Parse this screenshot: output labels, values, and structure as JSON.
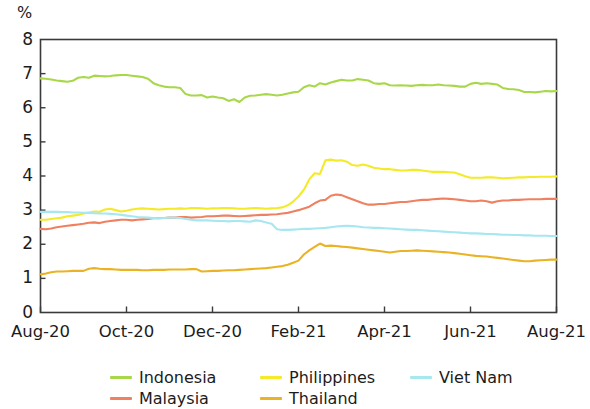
{
  "chart_data": {
    "type": "line",
    "title": "",
    "subtitle": "",
    "xlabel": "",
    "ylabel": "%",
    "ylim": [
      0,
      8
    ],
    "yticks": [
      0,
      1,
      2,
      3,
      4,
      5,
      6,
      7,
      8
    ],
    "ytick_labels": [
      "0",
      "1",
      "2",
      "3",
      "4",
      "5",
      "6",
      "7",
      "8"
    ],
    "xtick_labels": [
      "Aug-20",
      "Oct-20",
      "Dec-20",
      "Feb-21",
      "Apr-21",
      "Jun-21",
      "Aug-21"
    ],
    "x_range": [
      "Aug-20",
      "Aug-21"
    ],
    "grid": false,
    "frame": true,
    "legend_position": "bottom",
    "legend_columns": 3,
    "series": [
      {
        "name": "Indonesia",
        "color": "#a8d84a",
        "values": [
          6.86,
          6.85,
          6.83,
          6.8,
          6.78,
          6.76,
          6.79,
          6.88,
          6.9,
          6.88,
          6.94,
          6.93,
          6.92,
          6.93,
          6.95,
          6.96,
          6.96,
          6.94,
          6.92,
          6.9,
          6.85,
          6.72,
          6.66,
          6.62,
          6.6,
          6.6,
          6.58,
          6.4,
          6.36,
          6.36,
          6.37,
          6.3,
          6.33,
          6.3,
          6.28,
          6.2,
          6.25,
          6.17,
          6.3,
          6.35,
          6.36,
          6.38,
          6.4,
          6.38,
          6.36,
          6.38,
          6.42,
          6.45,
          6.47,
          6.6,
          6.66,
          6.62,
          6.72,
          6.68,
          6.74,
          6.78,
          6.82,
          6.8,
          6.8,
          6.84,
          6.82,
          6.8,
          6.72,
          6.7,
          6.72,
          6.66,
          6.65,
          6.66,
          6.65,
          6.64,
          6.66,
          6.67,
          6.66,
          6.66,
          6.68,
          6.66,
          6.65,
          6.64,
          6.62,
          6.62,
          6.7,
          6.73,
          6.7,
          6.72,
          6.7,
          6.68,
          6.58,
          6.55,
          6.54,
          6.52,
          6.46,
          6.46,
          6.45,
          6.47,
          6.49,
          6.48,
          6.49
        ]
      },
      {
        "name": "Philippines",
        "color": "#f4ea2a",
        "values": [
          2.72,
          2.72,
          2.74,
          2.76,
          2.78,
          2.82,
          2.84,
          2.86,
          2.9,
          2.93,
          2.96,
          2.95,
          3.02,
          3.04,
          3.0,
          2.96,
          2.98,
          3.02,
          3.04,
          3.05,
          3.04,
          3.03,
          3.02,
          3.03,
          3.04,
          3.04,
          3.05,
          3.04,
          3.06,
          3.06,
          3.05,
          3.04,
          3.05,
          3.05,
          3.06,
          3.06,
          3.05,
          3.04,
          3.04,
          3.05,
          3.06,
          3.05,
          3.04,
          3.05,
          3.06,
          3.08,
          3.14,
          3.25,
          3.4,
          3.6,
          3.9,
          4.08,
          4.06,
          4.46,
          4.48,
          4.45,
          4.46,
          4.42,
          4.32,
          4.3,
          4.34,
          4.3,
          4.24,
          4.22,
          4.2,
          4.2,
          4.18,
          4.16,
          4.16,
          4.18,
          4.18,
          4.16,
          4.14,
          4.12,
          4.12,
          4.12,
          4.11,
          4.1,
          4.05,
          3.99,
          3.95,
          3.95,
          3.95,
          3.96,
          3.96,
          3.95,
          3.93,
          3.94,
          3.95,
          3.96,
          3.96,
          3.97,
          3.97,
          3.98,
          3.98,
          3.98,
          3.99
        ]
      },
      {
        "name": "Malaysia",
        "color": "#ef8060",
        "values": [
          2.45,
          2.44,
          2.46,
          2.5,
          2.52,
          2.54,
          2.56,
          2.58,
          2.6,
          2.63,
          2.64,
          2.62,
          2.66,
          2.68,
          2.7,
          2.72,
          2.72,
          2.7,
          2.72,
          2.73,
          2.74,
          2.76,
          2.76,
          2.77,
          2.78,
          2.78,
          2.8,
          2.8,
          2.78,
          2.79,
          2.8,
          2.82,
          2.82,
          2.83,
          2.84,
          2.84,
          2.83,
          2.82,
          2.83,
          2.84,
          2.85,
          2.86,
          2.86,
          2.87,
          2.88,
          2.9,
          2.92,
          2.96,
          3.0,
          3.05,
          3.1,
          3.2,
          3.28,
          3.3,
          3.42,
          3.46,
          3.44,
          3.38,
          3.32,
          3.26,
          3.2,
          3.16,
          3.16,
          3.18,
          3.18,
          3.2,
          3.22,
          3.24,
          3.24,
          3.26,
          3.28,
          3.3,
          3.3,
          3.32,
          3.33,
          3.34,
          3.33,
          3.32,
          3.3,
          3.28,
          3.26,
          3.26,
          3.28,
          3.26,
          3.22,
          3.26,
          3.28,
          3.28,
          3.3,
          3.3,
          3.31,
          3.32,
          3.32,
          3.32,
          3.33,
          3.33,
          3.33
        ]
      },
      {
        "name": "Viet Nam",
        "color": "#a6e7f0",
        "values": [
          2.95,
          2.95,
          2.95,
          2.95,
          2.94,
          2.94,
          2.93,
          2.93,
          2.92,
          2.92,
          2.91,
          2.9,
          2.9,
          2.89,
          2.88,
          2.86,
          2.84,
          2.82,
          2.8,
          2.79,
          2.78,
          2.77,
          2.76,
          2.77,
          2.78,
          2.78,
          2.77,
          2.74,
          2.72,
          2.7,
          2.7,
          2.7,
          2.69,
          2.68,
          2.68,
          2.67,
          2.68,
          2.68,
          2.67,
          2.66,
          2.7,
          2.68,
          2.64,
          2.6,
          2.44,
          2.42,
          2.42,
          2.43,
          2.44,
          2.45,
          2.45,
          2.46,
          2.47,
          2.48,
          2.5,
          2.52,
          2.53,
          2.54,
          2.53,
          2.52,
          2.5,
          2.49,
          2.48,
          2.48,
          2.47,
          2.46,
          2.45,
          2.44,
          2.43,
          2.42,
          2.42,
          2.41,
          2.4,
          2.39,
          2.38,
          2.37,
          2.36,
          2.35,
          2.34,
          2.33,
          2.32,
          2.32,
          2.31,
          2.3,
          2.3,
          2.29,
          2.28,
          2.28,
          2.27,
          2.27,
          2.26,
          2.26,
          2.25,
          2.25,
          2.25,
          2.24,
          2.24
        ]
      },
      {
        "name": "Thailand",
        "color": "#eab325",
        "values": [
          1.12,
          1.14,
          1.18,
          1.2,
          1.2,
          1.21,
          1.22,
          1.22,
          1.22,
          1.28,
          1.3,
          1.28,
          1.27,
          1.27,
          1.26,
          1.25,
          1.25,
          1.25,
          1.25,
          1.24,
          1.24,
          1.25,
          1.25,
          1.25,
          1.26,
          1.26,
          1.26,
          1.26,
          1.27,
          1.27,
          1.2,
          1.21,
          1.22,
          1.22,
          1.23,
          1.24,
          1.24,
          1.25,
          1.26,
          1.27,
          1.28,
          1.29,
          1.3,
          1.32,
          1.34,
          1.36,
          1.4,
          1.46,
          1.52,
          1.7,
          1.82,
          1.92,
          2.02,
          1.95,
          1.96,
          1.95,
          1.93,
          1.92,
          1.9,
          1.88,
          1.86,
          1.84,
          1.82,
          1.8,
          1.78,
          1.76,
          1.78,
          1.8,
          1.8,
          1.81,
          1.82,
          1.81,
          1.8,
          1.79,
          1.78,
          1.77,
          1.76,
          1.74,
          1.72,
          1.7,
          1.68,
          1.66,
          1.65,
          1.64,
          1.62,
          1.6,
          1.58,
          1.56,
          1.54,
          1.52,
          1.5,
          1.5,
          1.52,
          1.53,
          1.54,
          1.55,
          1.55
        ]
      }
    ]
  },
  "axis": {
    "y_unit": "%"
  },
  "legend": {
    "items": [
      {
        "label": "Indonesia",
        "color": "#a8d84a"
      },
      {
        "label": "Philippines",
        "color": "#f4ea2a"
      },
      {
        "label": "Viet Nam",
        "color": "#a6e7f0"
      },
      {
        "label": "Malaysia",
        "color": "#ef8060"
      },
      {
        "label": "Thailand",
        "color": "#eab325"
      }
    ]
  }
}
